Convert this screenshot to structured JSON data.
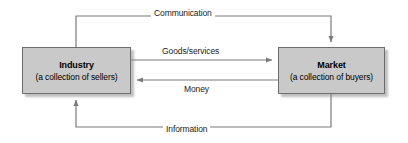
{
  "diagram": {
    "colors": {
      "box_fill": "#c9c9c9",
      "box_border": "#6e6e6e",
      "line": "#7a7a7a",
      "text": "#000000",
      "background": "#ffffff"
    },
    "nodes": [
      {
        "id": "industry",
        "title": "Industry",
        "subtitle": "(a collection of sellers)"
      },
      {
        "id": "market",
        "title": "Market",
        "subtitle": "(a collection of buyers)"
      }
    ],
    "edges": [
      {
        "id": "communication",
        "label": "Communication",
        "from": "industry",
        "to": "market",
        "direction": "industry-to-market",
        "route": "top"
      },
      {
        "id": "goods-services",
        "label": "Goods/services",
        "from": "industry",
        "to": "market",
        "direction": "industry-to-market",
        "route": "direct"
      },
      {
        "id": "money",
        "label": "Money",
        "from": "market",
        "to": "industry",
        "direction": "market-to-industry",
        "route": "direct"
      },
      {
        "id": "information",
        "label": "Information",
        "from": "market",
        "to": "industry",
        "direction": "market-to-industry",
        "route": "bottom"
      }
    ]
  }
}
